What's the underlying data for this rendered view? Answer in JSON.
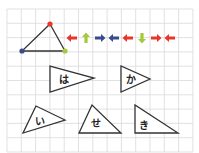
{
  "colors": {
    "grid": "#d9d9d9",
    "stroke": "#333333",
    "red": "#e8372a",
    "green": "#a6c93a",
    "blue": "#3a4a8c"
  },
  "grid": {
    "x0": 7,
    "y0": 9,
    "cols": 13,
    "rows": 10,
    "cell": 14.3
  },
  "reference_triangle": {
    "vertices": [
      {
        "name": "top",
        "x": 50,
        "y": 24,
        "color": "red"
      },
      {
        "name": "bottom-left",
        "x": 22,
        "y": 51,
        "color": "blue"
      },
      {
        "name": "bottom-right",
        "x": 65,
        "y": 51,
        "color": "green"
      }
    ]
  },
  "arrows": [
    {
      "x": 72,
      "y": 38,
      "dir": "left",
      "color": "red"
    },
    {
      "x": 86,
      "y": 38,
      "dir": "up",
      "color": "green"
    },
    {
      "x": 100,
      "y": 38,
      "dir": "right",
      "color": "blue"
    },
    {
      "x": 114,
      "y": 38,
      "dir": "left",
      "color": "blue"
    },
    {
      "x": 128,
      "y": 38,
      "dir": "left",
      "color": "red"
    },
    {
      "x": 142,
      "y": 38,
      "dir": "down",
      "color": "green"
    },
    {
      "x": 156,
      "y": 38,
      "dir": "right",
      "color": "red"
    },
    {
      "x": 170,
      "y": 38,
      "dir": "left",
      "color": "red"
    }
  ],
  "shapes": [
    {
      "label": "は",
      "points": [
        [
          50,
          66
        ],
        [
          50,
          92
        ],
        [
          94,
          78
        ]
      ],
      "lx": 64,
      "ly": 80
    },
    {
      "label": "か",
      "points": [
        [
          121,
          66
        ],
        [
          121,
          92
        ],
        [
          150,
          79
        ]
      ],
      "lx": 131,
      "ly": 80
    },
    {
      "label": "い",
      "points": [
        [
          36,
          106
        ],
        [
          23,
          133
        ],
        [
          65,
          120
        ]
      ],
      "lx": 40,
      "ly": 122
    },
    {
      "label": "せ",
      "points": [
        [
          92,
          105
        ],
        [
          79,
          133
        ],
        [
          121,
          133
        ]
      ],
      "lx": 96,
      "ly": 124
    },
    {
      "label": "き",
      "points": [
        [
          135,
          105
        ],
        [
          135,
          133
        ],
        [
          178,
          133
        ]
      ],
      "lx": 144,
      "ly": 126
    }
  ]
}
